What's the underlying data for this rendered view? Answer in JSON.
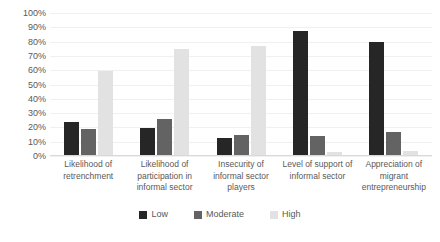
{
  "chart_data": {
    "type": "bar",
    "title": "",
    "subtitle": "",
    "xlabel": "",
    "ylabel": "",
    "ylim": [
      0,
      100
    ],
    "grid": true,
    "legend_position": "bottom",
    "y_ticks": [
      "100%",
      "90%",
      "80%",
      "70%",
      "60%",
      "50%",
      "40%",
      "30%",
      "20%",
      "10%",
      "0%"
    ],
    "y_tick_values": [
      100,
      90,
      80,
      70,
      60,
      50,
      40,
      30,
      20,
      10,
      0
    ],
    "categories": [
      "Likelihood of retrenchment",
      "Likelihood of participation in informal sector",
      "Insecurity of informal sector players",
      "Level of support of informal sector",
      "Appreciation of migrant entrepreneurship"
    ],
    "series": [
      {
        "name": "Low",
        "color": "#262626",
        "values": [
          23,
          19,
          12,
          87,
          79
        ]
      },
      {
        "name": "Moderate",
        "color": "#636363",
        "values": [
          18,
          25,
          14,
          13,
          16
        ]
      },
      {
        "name": "High",
        "color": "#e2e2e2",
        "values": [
          59,
          74,
          76,
          2,
          3
        ]
      }
    ]
  },
  "legend": {
    "items": [
      {
        "label": "Low",
        "color": "#262626"
      },
      {
        "label": "Moderate",
        "color": "#636363"
      },
      {
        "label": "High",
        "color": "#e2e2e2"
      }
    ]
  }
}
